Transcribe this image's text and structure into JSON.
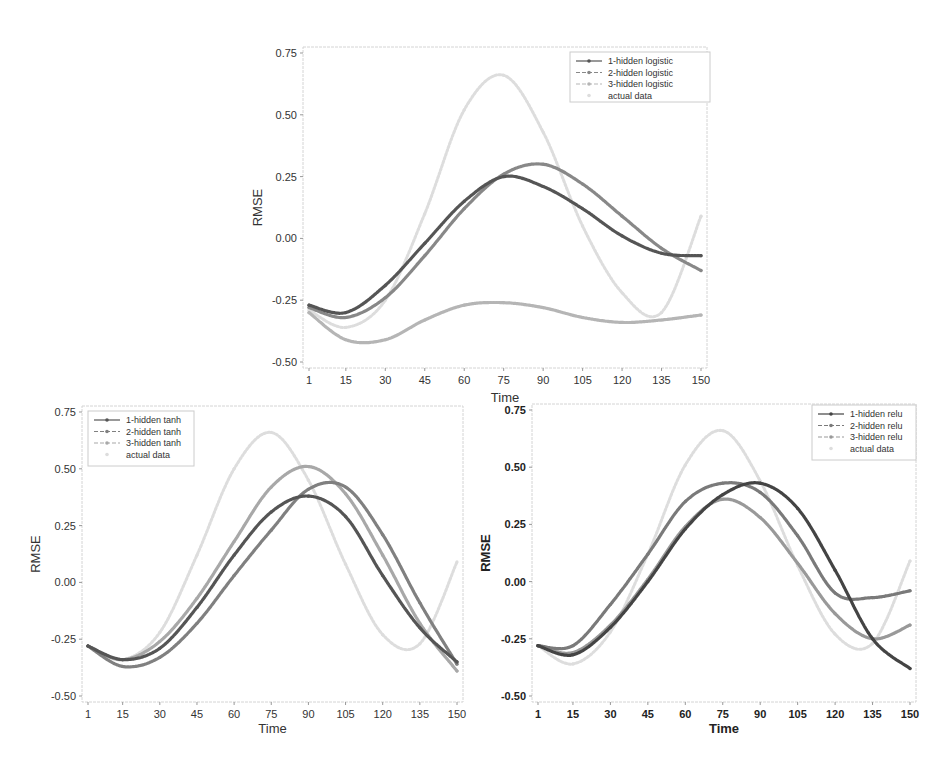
{
  "chart_data": [
    {
      "type": "line",
      "id": "logistic",
      "title": "",
      "xlabel": "Time",
      "ylabel": "RMSE",
      "xlim": [
        1,
        150
      ],
      "ylim": [
        -0.5,
        0.75
      ],
      "xticks": [
        1,
        15,
        30,
        45,
        60,
        75,
        90,
        105,
        120,
        135,
        150
      ],
      "xtick_labels": [
        "1",
        "15",
        "30",
        "45",
        "60",
        "75",
        "90",
        "105",
        "120",
        "135",
        "150"
      ],
      "yticks": [
        -0.5,
        -0.25,
        0.0,
        0.25,
        0.5,
        0.75
      ],
      "ytick_labels": [
        "-0.50",
        "-0.25",
        "0.00",
        "0.25",
        "0.50",
        "0.75"
      ],
      "legend_position": "top-right",
      "grid": false,
      "x": [
        1,
        15,
        30,
        45,
        60,
        75,
        90,
        105,
        120,
        135,
        150
      ],
      "series": [
        {
          "name": "1-hidden logistic",
          "color": "#555555",
          "values": [
            -0.27,
            -0.3,
            -0.19,
            -0.02,
            0.15,
            0.25,
            0.21,
            0.12,
            0.01,
            -0.06,
            -0.07
          ]
        },
        {
          "name": "2-hidden logistic",
          "color": "#888888",
          "values": [
            -0.28,
            -0.32,
            -0.24,
            -0.07,
            0.12,
            0.26,
            0.3,
            0.22,
            0.09,
            -0.04,
            -0.13
          ]
        },
        {
          "name": "3-hidden logistic",
          "color": "#b5b5b5",
          "values": [
            -0.3,
            -0.41,
            -0.41,
            -0.33,
            -0.27,
            -0.26,
            -0.28,
            -0.32,
            -0.34,
            -0.33,
            -0.31
          ]
        },
        {
          "name": "actual data",
          "color": "#dddddd",
          "values": [
            -0.29,
            -0.36,
            -0.25,
            0.1,
            0.52,
            0.66,
            0.43,
            0.05,
            -0.22,
            -0.3,
            0.09
          ]
        }
      ]
    },
    {
      "type": "line",
      "id": "tanh",
      "title": "",
      "xlabel": "Time",
      "ylabel": "RMSE",
      "xlim": [
        1,
        150
      ],
      "ylim": [
        -0.5,
        0.75
      ],
      "xticks": [
        1,
        15,
        30,
        45,
        60,
        75,
        90,
        105,
        120,
        135,
        150
      ],
      "xtick_labels": [
        "1",
        "15",
        "30",
        "45",
        "60",
        "75",
        "90",
        "105",
        "120",
        "135",
        "150"
      ],
      "yticks": [
        -0.5,
        -0.25,
        0.0,
        0.25,
        0.5,
        0.75
      ],
      "ytick_labels": [
        "-0.50",
        "-0.25",
        "0.00",
        "0.25",
        "0.50",
        "0.75"
      ],
      "legend_position": "top-left",
      "grid": false,
      "x": [
        1,
        15,
        30,
        45,
        60,
        75,
        90,
        105,
        120,
        135,
        150
      ],
      "series": [
        {
          "name": "1-hidden tanh",
          "color": "#555555",
          "values": [
            -0.28,
            -0.34,
            -0.29,
            -0.11,
            0.12,
            0.31,
            0.38,
            0.29,
            0.03,
            -0.2,
            -0.35
          ]
        },
        {
          "name": "2-hidden tanh",
          "color": "#808080",
          "values": [
            -0.28,
            -0.37,
            -0.33,
            -0.18,
            0.03,
            0.23,
            0.41,
            0.42,
            0.21,
            -0.09,
            -0.36
          ]
        },
        {
          "name": "3-hidden tanh",
          "color": "#a8a8a8",
          "values": [
            -0.28,
            -0.34,
            -0.26,
            -0.07,
            0.18,
            0.42,
            0.51,
            0.39,
            0.12,
            -0.18,
            -0.39
          ]
        },
        {
          "name": "actual data",
          "color": "#dddddd",
          "values": [
            -0.28,
            -0.34,
            -0.22,
            0.12,
            0.5,
            0.66,
            0.45,
            0.08,
            -0.23,
            -0.27,
            0.09
          ]
        }
      ]
    },
    {
      "type": "line",
      "id": "relu",
      "title": "",
      "xlabel": "Time",
      "ylabel": "RMSE",
      "xlim": [
        1,
        150
      ],
      "ylim": [
        -0.5,
        0.75
      ],
      "xticks": [
        1,
        15,
        30,
        45,
        60,
        75,
        90,
        105,
        120,
        135,
        150
      ],
      "xtick_labels": [
        "1",
        "15",
        "30",
        "45",
        "60",
        "75",
        "90",
        "105",
        "120",
        "135",
        "150"
      ],
      "yticks": [
        -0.5,
        -0.25,
        0.0,
        0.25,
        0.5,
        0.75
      ],
      "ytick_labels": [
        "-0.50",
        "-0.25",
        "0.00",
        "0.25",
        "0.50",
        "0.75"
      ],
      "legend_position": "top-right",
      "grid": false,
      "x": [
        1,
        15,
        30,
        45,
        60,
        75,
        90,
        105,
        120,
        135,
        150
      ],
      "series": [
        {
          "name": "1-hidden relu",
          "color": "#444444",
          "values": [
            -0.28,
            -0.32,
            -0.2,
            0.0,
            0.23,
            0.38,
            0.43,
            0.32,
            0.05,
            -0.25,
            -0.38
          ]
        },
        {
          "name": "2-hidden relu",
          "color": "#7a7a7a",
          "values": [
            -0.28,
            -0.28,
            -0.1,
            0.12,
            0.35,
            0.43,
            0.39,
            0.2,
            -0.05,
            -0.07,
            -0.04
          ]
        },
        {
          "name": "3-hidden relu",
          "color": "#999999",
          "values": [
            -0.28,
            -0.31,
            -0.19,
            0.01,
            0.24,
            0.36,
            0.28,
            0.08,
            -0.14,
            -0.25,
            -0.19
          ]
        },
        {
          "name": "actual data",
          "color": "#dddddd",
          "values": [
            -0.28,
            -0.36,
            -0.22,
            0.12,
            0.51,
            0.66,
            0.44,
            0.07,
            -0.23,
            -0.27,
            0.09
          ]
        }
      ]
    }
  ]
}
